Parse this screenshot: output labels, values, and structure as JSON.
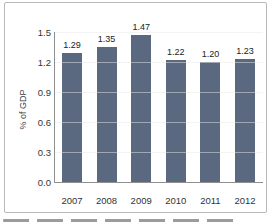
{
  "chart_data": {
    "type": "bar",
    "title": "",
    "categories": [
      "2007",
      "2008",
      "2009",
      "2010",
      "2011",
      "2012"
    ],
    "values": [
      1.29,
      1.35,
      1.47,
      1.22,
      1.2,
      1.23
    ],
    "value_labels": [
      "1.29",
      "1.35",
      "1.47",
      "1.22",
      "1.20",
      "1.23"
    ],
    "xlabel": "",
    "ylabel": "% of GDP",
    "ylim": [
      0,
      1.5
    ],
    "ytick_labels": [
      "0.0",
      "0.3",
      "0.6",
      "0.9",
      "1.2",
      "1.5"
    ],
    "grid": "horizontal",
    "legend": "none",
    "colors": {
      "bar": "#5a6880",
      "frame_border": "#b9b9b9",
      "axis": "#8f8f8f",
      "label_text": "#333333"
    }
  }
}
